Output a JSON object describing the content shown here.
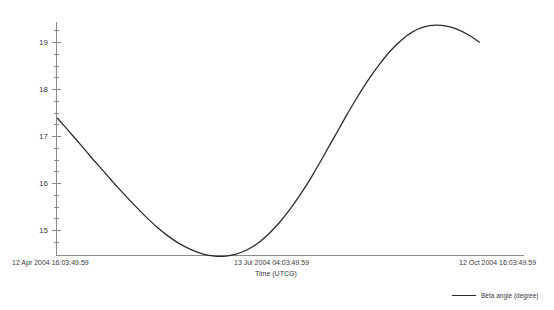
{
  "chart_data": {
    "type": "line",
    "title": "",
    "xlabel": "Time (UTCG)",
    "ylabel": "",
    "grid": false,
    "legend_position": "bottom-right",
    "x_tick_labels": [
      "12 Apr 2004 16:03:49.59",
      "13 Jul 2004 04:03:49.59",
      "12 Oct 2004 16:03:49.59"
    ],
    "x_tick_positions": [
      0,
      0.5,
      1.0
    ],
    "y_tick_labels": [
      "15",
      "16",
      "17",
      "18",
      "19"
    ],
    "y_ticks": [
      15,
      16,
      17,
      18,
      19
    ],
    "ylim": [
      14.3,
      19.6
    ],
    "xlim": [
      0,
      1
    ],
    "series": [
      {
        "name": "Beta angle (degree)",
        "color": "#2b2b2b",
        "x": [
          0.0,
          0.025,
          0.05,
          0.075,
          0.1,
          0.125,
          0.15,
          0.175,
          0.2,
          0.225,
          0.25,
          0.275,
          0.3,
          0.325,
          0.35,
          0.375,
          0.4,
          0.425,
          0.45,
          0.475,
          0.5,
          0.525,
          0.55,
          0.575,
          0.6,
          0.625,
          0.65,
          0.675,
          0.7,
          0.725,
          0.75,
          0.775,
          0.8,
          0.825,
          0.85,
          0.875,
          0.9,
          0.925,
          0.95
        ],
        "values": [
          17.4,
          17.13,
          16.86,
          16.58,
          16.31,
          16.04,
          15.78,
          15.53,
          15.29,
          15.07,
          14.88,
          14.72,
          14.6,
          14.51,
          14.46,
          14.45,
          14.49,
          14.58,
          14.72,
          14.92,
          15.17,
          15.47,
          15.81,
          16.19,
          16.6,
          17.02,
          17.44,
          17.84,
          18.21,
          18.54,
          18.83,
          19.06,
          19.23,
          19.33,
          19.37,
          19.35,
          19.28,
          19.16,
          19.0
        ]
      }
    ],
    "minimum": {
      "x": 0.375,
      "value": 14.45
    },
    "maximum": {
      "x": 0.85,
      "value": 19.37
    }
  },
  "legend": {
    "entries": [
      {
        "label": "Beta angle (degree)",
        "color": "#2b2b2b"
      }
    ]
  },
  "axes": {
    "x_title": "Time (UTCG)"
  }
}
